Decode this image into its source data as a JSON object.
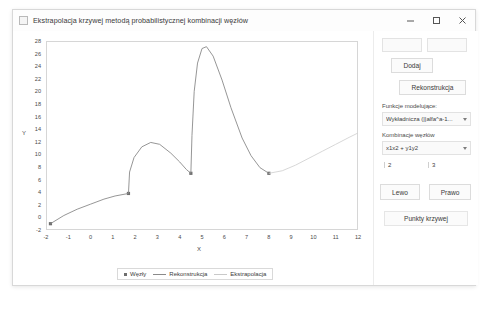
{
  "window": {
    "title": "Ekstrapolacja krzywej metodą probabilistycznej kombinacji węzłów",
    "app_icon": "app-icon",
    "controls": {
      "minimize": "minimize-icon",
      "maximize": "maximize-icon",
      "close": "close-icon"
    }
  },
  "panel": {
    "input_x": {
      "value": "",
      "placeholder": ""
    },
    "input_y": {
      "value": "",
      "placeholder": ""
    },
    "add_label": "Dodaj",
    "reconstruct_label": "Rekonstrukcja",
    "model_function_label": "Funkcje modelujące:",
    "model_function_value": "Wykładnicza (||alfa^a-1...",
    "node_combination_label": "Kombinacje węzłów",
    "node_combination_value": "x1x2 + y1y2",
    "num_left": "2",
    "num_right": "3",
    "left_label": "Lewo",
    "right_label": "Prawo",
    "curve_points_label": "Punkty krzywej"
  },
  "chart_data": {
    "type": "line",
    "title": "",
    "xlabel": "X",
    "ylabel": "Y",
    "xlim": [
      -2,
      12
    ],
    "ylim": [
      -2,
      28
    ],
    "xticks": [
      -2,
      -1,
      0,
      1,
      2,
      3,
      4,
      5,
      6,
      7,
      8,
      9,
      10,
      11,
      12
    ],
    "yticks": [
      -2,
      0,
      2,
      4,
      6,
      8,
      10,
      12,
      14,
      16,
      18,
      20,
      22,
      24,
      26,
      28
    ],
    "grid": false,
    "legend_position": "bottom",
    "legend": [
      {
        "name": "Węzły",
        "style": "marker",
        "color": "#6e6e6e"
      },
      {
        "name": "Rekonstrukcja",
        "style": "solid",
        "color": "#8a8a8a"
      },
      {
        "name": "Ekstrapolacja",
        "style": "solid-light",
        "color": "#c9c9c9"
      }
    ],
    "series": [
      {
        "name": "Węzły",
        "type": "scatter",
        "color": "#6e6e6e",
        "points": [
          {
            "x": -1.8,
            "y": -1.0
          },
          {
            "x": 1.7,
            "y": 3.8
          },
          {
            "x": 4.5,
            "y": 7.0
          },
          {
            "x": 8.0,
            "y": 7.0
          }
        ]
      },
      {
        "name": "Rekonstrukcja",
        "type": "line",
        "color": "#8a8a8a",
        "points": [
          {
            "x": -1.8,
            "y": -1.0
          },
          {
            "x": -1.2,
            "y": 0.3
          },
          {
            "x": -0.6,
            "y": 1.3
          },
          {
            "x": 0.0,
            "y": 2.1
          },
          {
            "x": 0.6,
            "y": 2.9
          },
          {
            "x": 1.1,
            "y": 3.4
          },
          {
            "x": 1.7,
            "y": 3.8
          },
          {
            "x": 1.75,
            "y": 7.2
          },
          {
            "x": 1.95,
            "y": 9.5
          },
          {
            "x": 2.3,
            "y": 11.2
          },
          {
            "x": 2.7,
            "y": 11.9
          },
          {
            "x": 3.1,
            "y": 11.6
          },
          {
            "x": 3.6,
            "y": 10.2
          },
          {
            "x": 4.0,
            "y": 8.8
          },
          {
            "x": 4.3,
            "y": 7.6
          },
          {
            "x": 4.5,
            "y": 7.0
          },
          {
            "x": 4.55,
            "y": 13.0
          },
          {
            "x": 4.65,
            "y": 20.0
          },
          {
            "x": 4.8,
            "y": 24.5
          },
          {
            "x": 5.0,
            "y": 26.8
          },
          {
            "x": 5.2,
            "y": 27.1
          },
          {
            "x": 5.5,
            "y": 25.6
          },
          {
            "x": 5.9,
            "y": 21.8
          },
          {
            "x": 6.3,
            "y": 17.4
          },
          {
            "x": 6.8,
            "y": 12.6
          },
          {
            "x": 7.2,
            "y": 9.8
          },
          {
            "x": 7.6,
            "y": 7.9
          },
          {
            "x": 8.0,
            "y": 7.0
          }
        ]
      },
      {
        "name": "Ekstrapolacja",
        "type": "line",
        "color": "#d2d2d2",
        "points": [
          {
            "x": 8.0,
            "y": 7.0
          },
          {
            "x": 8.6,
            "y": 7.4
          },
          {
            "x": 9.2,
            "y": 8.3
          },
          {
            "x": 9.8,
            "y": 9.4
          },
          {
            "x": 10.4,
            "y": 10.5
          },
          {
            "x": 11.0,
            "y": 11.6
          },
          {
            "x": 11.6,
            "y": 12.7
          },
          {
            "x": 12.0,
            "y": 13.4
          }
        ]
      }
    ]
  }
}
